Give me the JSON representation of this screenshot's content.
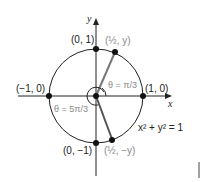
{
  "diagram": {
    "axes": {
      "x_label": "x",
      "y_label": "y"
    },
    "points": {
      "top": "(0, 1)",
      "bottom": "(0, −1)",
      "left": "(−1, 0)",
      "right": "(1, 0)",
      "upper": "(½, y)",
      "lower": "(½, −y)"
    },
    "angles": {
      "theta1": "θ = π/3",
      "theta2": "θ = 5π/3"
    },
    "equation": "x² + y² = 1",
    "colors": {
      "line": "#222222",
      "radius": "#777777",
      "label_gray": "#888888"
    }
  }
}
